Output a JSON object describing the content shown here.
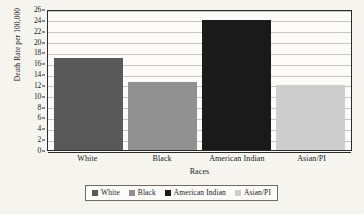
{
  "chart_data": {
    "type": "bar",
    "title": "",
    "xlabel": "Races",
    "ylabel": "Death Rate per 100,000",
    "categories": [
      "White",
      "Black",
      "American Indian",
      "Asian/PI"
    ],
    "values": [
      17,
      12.5,
      24,
      12
    ],
    "ylim": [
      0,
      26
    ],
    "ytick_step": 2,
    "yticks": [
      "26",
      "24",
      "22",
      "20",
      "18",
      "16",
      "14",
      "12",
      "10",
      "8",
      "6",
      "4",
      "2",
      "0"
    ],
    "grid": true,
    "legend_position": "bottom",
    "series": [
      {
        "name": "White",
        "value": 17,
        "color": "#595959"
      },
      {
        "name": "Black",
        "value": 12.5,
        "color": "#919191"
      },
      {
        "name": "American Indian",
        "value": 24,
        "color": "#1a1a1a"
      },
      {
        "name": "Asian/PI",
        "value": 12,
        "color": "#cecece"
      }
    ]
  },
  "legend": {
    "items": [
      {
        "label": "White",
        "color": "#595959"
      },
      {
        "label": "Black",
        "color": "#919191"
      },
      {
        "label": "American Indian",
        "color": "#1a1a1a"
      },
      {
        "label": "Asian/PI",
        "color": "#cecece"
      }
    ]
  },
  "colors": {
    "plot_background": "#fdfcf9",
    "page_background": "#f7f5f0",
    "axis": "#2b2b2b",
    "gridline": "#c9c6be",
    "text": "#1a1a1a"
  }
}
